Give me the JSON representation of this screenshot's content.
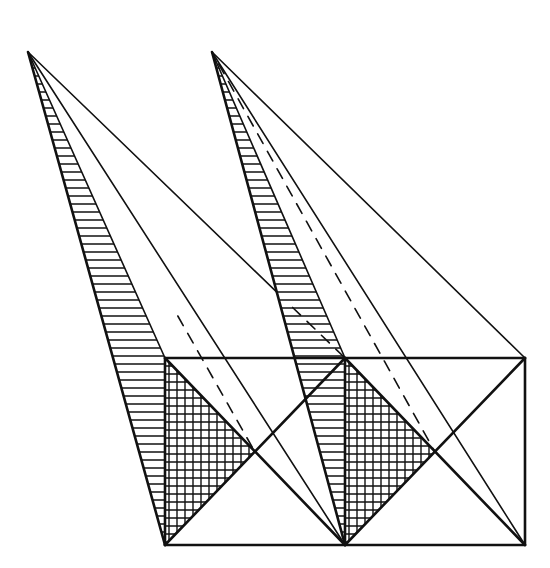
{
  "diagram": {
    "title": "",
    "colors": {
      "ink": "#111111",
      "background": "#ffffff"
    },
    "apexes": [
      {
        "id": "A1",
        "x": 28,
        "y": 52
      },
      {
        "id": "A2",
        "x": 212,
        "y": 52
      }
    ],
    "rectangle": {
      "top": 358,
      "bottom": 545,
      "x_left": 165,
      "x_mid": 345,
      "x_right": 525
    },
    "square_centers": [
      {
        "id": "C1",
        "x": 255,
        "y": 452
      },
      {
        "id": "C2",
        "x": 435,
        "y": 452
      }
    ],
    "hatch_spacing": 8,
    "labels": []
  }
}
